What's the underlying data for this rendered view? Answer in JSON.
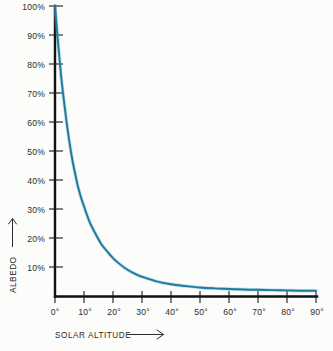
{
  "chart_data": {
    "type": "line",
    "title": "",
    "xlabel": "SOLAR ALTITUDE",
    "ylabel": "ALBEDO",
    "xlim": [
      0,
      90
    ],
    "ylim": [
      0,
      100
    ],
    "grid": false,
    "legend": "none",
    "x_tick_labels": [
      "0°",
      "10°",
      "20°",
      "30°",
      "40°",
      "50°",
      "60°",
      "70°",
      "80°",
      "90°"
    ],
    "x_ticks": [
      0,
      10,
      20,
      30,
      40,
      50,
      60,
      70,
      80,
      90
    ],
    "y_tick_labels": [
      "10%",
      "20%",
      "30%",
      "40%",
      "50%",
      "60%",
      "70%",
      "80%",
      "90%",
      "100%"
    ],
    "y_ticks": [
      10,
      20,
      30,
      40,
      50,
      60,
      70,
      80,
      90,
      100
    ],
    "series": [
      {
        "name": "Albedo vs solar altitude",
        "color": "#1f7a9c",
        "x": [
          0,
          1,
          2,
          3,
          4,
          5,
          6,
          7,
          8,
          9,
          10,
          12,
          14,
          16,
          18,
          20,
          22,
          25,
          28,
          30,
          35,
          40,
          45,
          50,
          55,
          60,
          65,
          70,
          75,
          80,
          85,
          90
        ],
        "values": [
          100,
          88,
          77,
          68,
          60,
          53,
          47,
          42,
          37.5,
          34,
          31,
          25.5,
          21.5,
          18,
          15.5,
          13.2,
          11.4,
          9.2,
          7.6,
          6.8,
          5.2,
          4.2,
          3.6,
          3.1,
          2.8,
          2.6,
          2.4,
          2.3,
          2.2,
          2.1,
          2.0,
          2.0
        ]
      }
    ],
    "x_axis_arrow": "→",
    "y_axis_arrow": "↑",
    "colors": {
      "curve": "#1f7a9c",
      "curve_highlight": "#58a8c8",
      "axis": "#111111",
      "text": "#2b2b2b",
      "background": "#fcfcfa"
    }
  }
}
